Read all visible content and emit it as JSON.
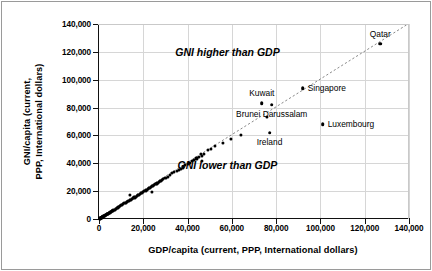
{
  "chart_data": {
    "type": "scatter",
    "title": "",
    "xlabel": "GDP/capita (current, PPP, International dollars)",
    "ylabel_line1": "GNI/capita (current,",
    "ylabel_line2": "PPP, International dollars)",
    "xlim": [
      0,
      140000
    ],
    "ylim": [
      0,
      140000
    ],
    "grid": true,
    "legend": "none",
    "xticks": [
      "0",
      "20,000",
      "40,000",
      "60,000",
      "80,000",
      "100,000",
      "120,000",
      "140,000"
    ],
    "xtick_values": [
      0,
      20000,
      40000,
      60000,
      80000,
      100000,
      120000,
      140000
    ],
    "yticks": [
      "0",
      "20,000",
      "40,000",
      "60,000",
      "80,000",
      "100,000",
      "120,000",
      "140,000"
    ],
    "ytick_values": [
      0,
      20000,
      40000,
      60000,
      80000,
      100000,
      120000,
      140000
    ],
    "reference_line": {
      "type": "identity",
      "from": [
        0,
        0
      ],
      "to": [
        140000,
        140000
      ],
      "style": "dotted"
    },
    "annotations": [
      {
        "text": "GNI higher than GDP",
        "x": 58000,
        "y": 120000
      },
      {
        "text": "GNI lower than GDP",
        "x": 58000,
        "y": 39000
      }
    ],
    "labeled_points": [
      {
        "name": "Qatar",
        "x": 127000,
        "y": 126000,
        "label_pos": "above"
      },
      {
        "name": "Singapore",
        "x": 92000,
        "y": 94000,
        "label_pos": "right"
      },
      {
        "name": "Kuwait",
        "x": 73500,
        "y": 83000,
        "label_pos": "above"
      },
      {
        "name": "Brunei Darussalam",
        "x": 78000,
        "y": 82000,
        "label_pos": "below"
      },
      {
        "name": "Luxembourg",
        "x": 101000,
        "y": 68000,
        "label_pos": "right"
      },
      {
        "name": "Ireland",
        "x": 77000,
        "y": 62000,
        "label_pos": "below"
      }
    ],
    "extra_points": [
      {
        "x": 76000,
        "y": 73500
      },
      {
        "x": 64000,
        "y": 60500
      },
      {
        "x": 59500,
        "y": 57500
      },
      {
        "x": 56000,
        "y": 54500
      },
      {
        "x": 52500,
        "y": 52500
      },
      {
        "x": 50500,
        "y": 50500
      },
      {
        "x": 49000,
        "y": 49500
      },
      {
        "x": 47500,
        "y": 47000
      },
      {
        "x": 46500,
        "y": 42000
      },
      {
        "x": 46500,
        "y": 45000
      },
      {
        "x": 46000,
        "y": 46500
      },
      {
        "x": 45000,
        "y": 44500
      },
      {
        "x": 44000,
        "y": 43500
      },
      {
        "x": 43000,
        "y": 42500
      },
      {
        "x": 42000,
        "y": 41800
      },
      {
        "x": 41000,
        "y": 40500
      },
      {
        "x": 40000,
        "y": 39500
      },
      {
        "x": 39000,
        "y": 38500
      },
      {
        "x": 38000,
        "y": 37000
      },
      {
        "x": 37000,
        "y": 36000
      },
      {
        "x": 36000,
        "y": 35500
      },
      {
        "x": 35000,
        "y": 34500
      },
      {
        "x": 34000,
        "y": 33500
      },
      {
        "x": 33000,
        "y": 33000
      },
      {
        "x": 32000,
        "y": 31500
      },
      {
        "x": 31000,
        "y": 30500
      },
      {
        "x": 30000,
        "y": 29500
      },
      {
        "x": 29000,
        "y": 28500
      },
      {
        "x": 28500,
        "y": 28000
      },
      {
        "x": 28000,
        "y": 27500
      },
      {
        "x": 27500,
        "y": 27000
      },
      {
        "x": 27000,
        "y": 26500
      },
      {
        "x": 26500,
        "y": 26000
      },
      {
        "x": 26000,
        "y": 25500
      },
      {
        "x": 25500,
        "y": 25000
      },
      {
        "x": 25000,
        "y": 24500
      },
      {
        "x": 24500,
        "y": 24000
      },
      {
        "x": 24000,
        "y": 23500
      },
      {
        "x": 24000,
        "y": 19500
      },
      {
        "x": 23500,
        "y": 23000
      },
      {
        "x": 23000,
        "y": 22500
      },
      {
        "x": 22500,
        "y": 22000
      },
      {
        "x": 22000,
        "y": 21500
      },
      {
        "x": 21500,
        "y": 21000
      },
      {
        "x": 21000,
        "y": 20500
      },
      {
        "x": 20500,
        "y": 20000
      },
      {
        "x": 20000,
        "y": 19500
      },
      {
        "x": 19500,
        "y": 19000
      },
      {
        "x": 19000,
        "y": 18500
      },
      {
        "x": 18500,
        "y": 18000
      },
      {
        "x": 18000,
        "y": 17500
      },
      {
        "x": 17500,
        "y": 17000
      },
      {
        "x": 17000,
        "y": 16500
      },
      {
        "x": 16500,
        "y": 16000
      },
      {
        "x": 16000,
        "y": 15500
      },
      {
        "x": 15500,
        "y": 15000
      },
      {
        "x": 15000,
        "y": 14500
      },
      {
        "x": 14500,
        "y": 14000
      },
      {
        "x": 14000,
        "y": 17500
      },
      {
        "x": 14000,
        "y": 13500
      },
      {
        "x": 13500,
        "y": 13000
      },
      {
        "x": 13000,
        "y": 12800
      },
      {
        "x": 12500,
        "y": 12200
      },
      {
        "x": 12000,
        "y": 11800
      },
      {
        "x": 11500,
        "y": 11200
      },
      {
        "x": 11000,
        "y": 10800
      },
      {
        "x": 10500,
        "y": 10200
      },
      {
        "x": 10000,
        "y": 9800
      },
      {
        "x": 9500,
        "y": 9300
      },
      {
        "x": 9000,
        "y": 8800
      },
      {
        "x": 8500,
        "y": 8300
      },
      {
        "x": 8000,
        "y": 7800
      },
      {
        "x": 7500,
        "y": 7300
      },
      {
        "x": 7000,
        "y": 6800
      },
      {
        "x": 6800,
        "y": 6600
      },
      {
        "x": 6500,
        "y": 6300
      },
      {
        "x": 6200,
        "y": 6000
      },
      {
        "x": 6000,
        "y": 5800
      },
      {
        "x": 5800,
        "y": 5600
      },
      {
        "x": 5500,
        "y": 5300
      },
      {
        "x": 5200,
        "y": 5000
      },
      {
        "x": 5000,
        "y": 4800
      },
      {
        "x": 4800,
        "y": 4600
      },
      {
        "x": 4500,
        "y": 4300
      },
      {
        "x": 4300,
        "y": 4100
      },
      {
        "x": 4000,
        "y": 3900
      },
      {
        "x": 3800,
        "y": 3700
      },
      {
        "x": 3600,
        "y": 3500
      },
      {
        "x": 3400,
        "y": 3300
      },
      {
        "x": 3200,
        "y": 3100
      },
      {
        "x": 3000,
        "y": 2900
      },
      {
        "x": 2800,
        "y": 2700
      },
      {
        "x": 2600,
        "y": 2500
      },
      {
        "x": 2400,
        "y": 2300
      },
      {
        "x": 2200,
        "y": 2100
      },
      {
        "x": 2000,
        "y": 1900
      },
      {
        "x": 1800,
        "y": 1750
      },
      {
        "x": 1600,
        "y": 1550
      },
      {
        "x": 1500,
        "y": 1450
      },
      {
        "x": 1400,
        "y": 1350
      },
      {
        "x": 1300,
        "y": 1250
      },
      {
        "x": 1200,
        "y": 1150
      },
      {
        "x": 1100,
        "y": 1050
      },
      {
        "x": 1000,
        "y": 950
      },
      {
        "x": 900,
        "y": 870
      },
      {
        "x": 800,
        "y": 780
      },
      {
        "x": 700,
        "y": 680
      },
      {
        "x": 600,
        "y": 580
      },
      {
        "x": 500,
        "y": 480
      },
      {
        "x": 400,
        "y": 390
      },
      {
        "x": 300,
        "y": 290
      }
    ]
  },
  "colors": {
    "marker": "#000000",
    "grid": "#d6d6d6",
    "axis": "#111111",
    "frame": "#9a9a9a",
    "background": "#ffffff"
  }
}
